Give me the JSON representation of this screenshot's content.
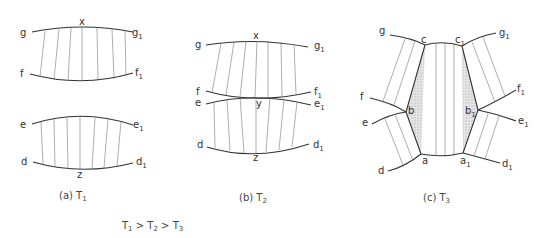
{
  "figure": {
    "panels": [
      {
        "id": "a",
        "caption": "(a) T",
        "caption_sub": "1",
        "labels": {
          "g": "g",
          "g1": "g",
          "f": "f",
          "f1": "f",
          "e": "e",
          "e1": "e",
          "d": "d",
          "d1": "d",
          "x": "x",
          "z": "z"
        }
      },
      {
        "id": "b",
        "caption": "(b) T",
        "caption_sub": "2",
        "labels": {
          "g": "g",
          "g1": "g",
          "f": "f",
          "f1": "f",
          "e": "e",
          "e1": "e",
          "d": "d",
          "d1": "d",
          "x": "x",
          "y": "y",
          "z": "z"
        }
      },
      {
        "id": "c",
        "caption": "(c) T",
        "caption_sub": "3",
        "labels": {
          "g": "g",
          "g1": "g",
          "f": "f",
          "f1": "f",
          "e": "e",
          "e1": "e",
          "d": "d",
          "d1": "d",
          "a": "a",
          "a1": "a",
          "b": "b",
          "b1": "b",
          "c": "c",
          "c1": "c"
        }
      }
    ],
    "subscript_one": "1",
    "relation": {
      "t1": "T",
      "s1": "1",
      "gt1": " > ",
      "t2": "T",
      "s2": "2",
      "gt2": " > ",
      "t3": "T",
      "s3": "3"
    }
  }
}
